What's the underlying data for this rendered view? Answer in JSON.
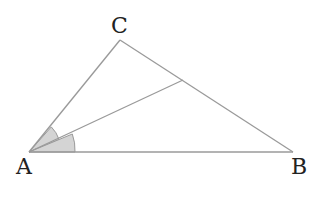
{
  "diagram": {
    "vertices": [
      {
        "id": "A",
        "label": "A",
        "x": 29,
        "y": 152
      },
      {
        "id": "B",
        "label": "B",
        "x": 293,
        "y": 152
      },
      {
        "id": "C",
        "label": "C",
        "x": 120,
        "y": 40
      }
    ],
    "bisector_foot": {
      "x": 183,
      "y": 80
    },
    "colors": {
      "line": "#9a9a9a",
      "angle_fill": "#d4d4d4",
      "label": "#222222"
    },
    "angle_marks": [
      {
        "at": "A",
        "between": [
          "C",
          "bisector_foot"
        ],
        "radius": 32,
        "shaded": true
      },
      {
        "at": "A",
        "between": [
          "bisector_foot",
          "B"
        ],
        "radius": 46,
        "shaded": true
      }
    ]
  }
}
